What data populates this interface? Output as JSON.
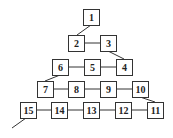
{
  "diagram": {
    "type": "numbered-path-triangle",
    "nodes": [
      {
        "label": "1",
        "x": 83,
        "y": 9
      },
      {
        "label": "2",
        "x": 68,
        "y": 35
      },
      {
        "label": "3",
        "x": 100,
        "y": 35
      },
      {
        "label": "4",
        "x": 116,
        "y": 59
      },
      {
        "label": "5",
        "x": 84,
        "y": 59
      },
      {
        "label": "6",
        "x": 52,
        "y": 59
      },
      {
        "label": "7",
        "x": 37,
        "y": 81
      },
      {
        "label": "8",
        "x": 68,
        "y": 81
      },
      {
        "label": "9",
        "x": 100,
        "y": 81
      },
      {
        "label": "10",
        "x": 132,
        "y": 81
      },
      {
        "label": "11",
        "x": 147,
        "y": 102
      },
      {
        "label": "12",
        "x": 115,
        "y": 102
      },
      {
        "label": "13",
        "x": 83,
        "y": 102
      },
      {
        "label": "14",
        "x": 51,
        "y": 102
      },
      {
        "label": "15",
        "x": 20,
        "y": 102
      }
    ],
    "edges": [
      [
        "1",
        "2"
      ],
      [
        "2",
        "3"
      ],
      [
        "3",
        "4"
      ],
      [
        "4",
        "5"
      ],
      [
        "5",
        "6"
      ],
      [
        "6",
        "7"
      ],
      [
        "7",
        "8"
      ],
      [
        "8",
        "9"
      ],
      [
        "9",
        "10"
      ],
      [
        "10",
        "11"
      ],
      [
        "11",
        "12"
      ],
      [
        "12",
        "13"
      ],
      [
        "13",
        "14"
      ],
      [
        "14",
        "15"
      ],
      [
        "15",
        "out"
      ]
    ],
    "colors": {
      "stroke": "#333333",
      "text": "#222222",
      "background": "#ffffff"
    }
  }
}
